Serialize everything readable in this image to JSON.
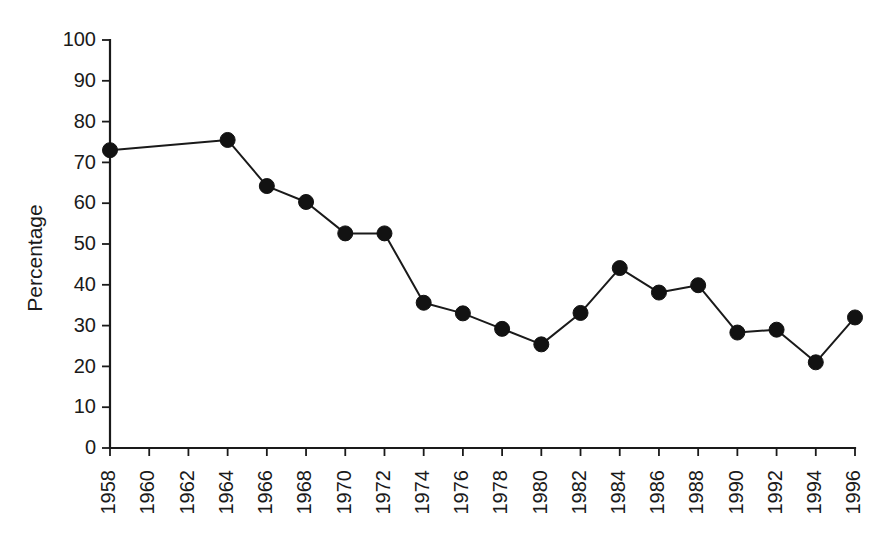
{
  "chart_data": {
    "type": "line",
    "title": "",
    "subtitle": "",
    "xlabel": "",
    "ylabel": "Percentage",
    "xlim": [
      1958,
      1996
    ],
    "ylim": [
      0,
      100
    ],
    "grid": false,
    "legend": null,
    "x_tick_labels": [
      "1958",
      "1960",
      "1962",
      "1964",
      "1966",
      "1968",
      "1970",
      "1972",
      "1974",
      "1976",
      "1978",
      "1980",
      "1982",
      "1984",
      "1986",
      "1988",
      "1990",
      "1992",
      "1994",
      "1996"
    ],
    "x_tick_values": [
      1958,
      1960,
      1962,
      1964,
      1966,
      1968,
      1970,
      1972,
      1974,
      1976,
      1978,
      1980,
      1982,
      1984,
      1986,
      1988,
      1990,
      1992,
      1994,
      1996
    ],
    "y_tick_labels": [
      "0",
      "10",
      "20",
      "30",
      "40",
      "50",
      "60",
      "70",
      "80",
      "90",
      "100"
    ],
    "y_tick_values": [
      0,
      10,
      20,
      30,
      40,
      50,
      60,
      70,
      80,
      90,
      100
    ],
    "x_tick_label_rotation": -90,
    "series": [
      {
        "name": "Percentage",
        "color": "#121212",
        "marker": "filled-circle",
        "x": [
          1958,
          1964,
          1966,
          1968,
          1970,
          1972,
          1974,
          1976,
          1978,
          1980,
          1982,
          1984,
          1986,
          1988,
          1990,
          1992,
          1994,
          1996
        ],
        "values": [
          73.0,
          75.5,
          64.2,
          60.3,
          52.6,
          52.6,
          35.6,
          33.0,
          29.2,
          25.4,
          33.1,
          44.1,
          38.1,
          39.9,
          28.3,
          29.0,
          21.0,
          32.0
        ]
      }
    ]
  },
  "layout": {
    "plot_left": 110,
    "plot_right": 855,
    "plot_top": 40,
    "plot_bottom": 448,
    "y_label_x": 42,
    "y_label_y": 258,
    "tick_len": 8,
    "marker_radius": 7.5,
    "x_label_offset": 14
  }
}
